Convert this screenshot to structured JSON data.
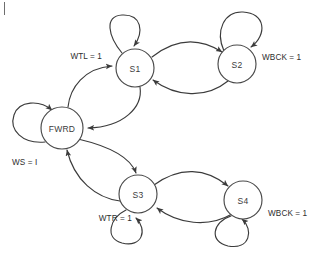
{
  "diagram": {
    "type": "finite-state-machine",
    "background_color": "#ffffff",
    "stroke_color": "#3b3b3b",
    "text_color": "#2e2e2e",
    "states": [
      {
        "id": "FWRD",
        "label": "FWRD",
        "cx": 62,
        "cy": 128,
        "r": 21
      },
      {
        "id": "S1",
        "label": "S1",
        "cx": 135,
        "cy": 68,
        "r": 19
      },
      {
        "id": "S2",
        "label": "S2",
        "cx": 237,
        "cy": 64,
        "r": 19
      },
      {
        "id": "S3",
        "label": "S3",
        "cx": 138,
        "cy": 194,
        "r": 19
      },
      {
        "id": "S4",
        "label": "S4",
        "cx": 243,
        "cy": 200,
        "r": 19
      }
    ],
    "edge_labels": [
      {
        "id": "wtl",
        "text": "WTL = 1",
        "x": 102,
        "y": 56,
        "anchor": "end"
      },
      {
        "id": "wbck-s2",
        "text": "WBCK = 1",
        "x": 262,
        "y": 57,
        "anchor": "start"
      },
      {
        "id": "ws",
        "text": "WS = I",
        "x": 12,
        "y": 162,
        "anchor": "start"
      },
      {
        "id": "wtr",
        "text": "WTR = 1",
        "x": 132,
        "y": 218,
        "anchor": "end"
      },
      {
        "id": "wbck-s4",
        "text": "WBCK = 1",
        "x": 268,
        "y": 213,
        "anchor": "start"
      }
    ],
    "transitions": [
      {
        "from": "FWRD",
        "to": "S1",
        "label": "WTL = 1"
      },
      {
        "from": "S1",
        "to": "FWRD",
        "label": ""
      },
      {
        "from": "S1",
        "to": "S2",
        "label": ""
      },
      {
        "from": "S2",
        "to": "S1",
        "label": ""
      },
      {
        "from": "S2",
        "to": "S2",
        "label": "WBCK = 1"
      },
      {
        "from": "S1",
        "to": "S1",
        "label": ""
      },
      {
        "from": "FWRD",
        "to": "FWRD",
        "label": "WS = I"
      },
      {
        "from": "FWRD",
        "to": "S3",
        "label": ""
      },
      {
        "from": "S3",
        "to": "FWRD",
        "label": ""
      },
      {
        "from": "S3",
        "to": "S4",
        "label": ""
      },
      {
        "from": "S4",
        "to": "S3",
        "label": ""
      },
      {
        "from": "S3",
        "to": "S3",
        "label": "WTR = 1"
      },
      {
        "from": "S4",
        "to": "S4",
        "label": "WBCK = 1"
      }
    ]
  }
}
